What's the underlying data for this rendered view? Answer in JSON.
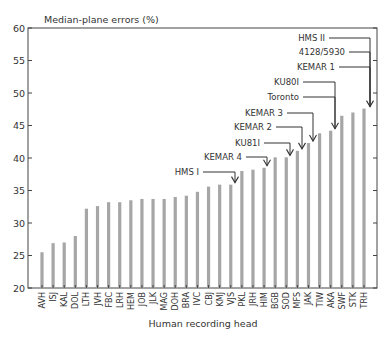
{
  "chart_data": {
    "type": "bar",
    "title": "",
    "ylabel": "Median-plane errors (%)",
    "xlabel": "Human recording head",
    "ylim": [
      20,
      60
    ],
    "yticks": [
      20,
      25,
      30,
      35,
      40,
      45,
      50,
      55,
      60
    ],
    "grid": false,
    "legend": null,
    "categories": [
      "AVH",
      "ISJ",
      "KAL",
      "DOL",
      "LTH",
      "JVH",
      "FBC",
      "LRH",
      "HEM",
      "JOB",
      "JLK",
      "MAG",
      "DOH",
      "BRA",
      "IVC",
      "CBJ",
      "KMJ",
      "VJS",
      "PKL",
      "JRH",
      "HIM",
      "BGB",
      "SOD",
      "MFS",
      "JAK",
      "TIW",
      "AKA",
      "SWF",
      "STK",
      "TRH"
    ],
    "values": [
      25.5,
      26.9,
      27.0,
      28.0,
      32.2,
      32.6,
      33.2,
      33.2,
      33.5,
      33.7,
      33.7,
      33.7,
      34.0,
      34.2,
      34.8,
      35.6,
      35.9,
      35.9,
      38.0,
      38.2,
      38.5,
      40.1,
      40.1,
      41.1,
      42.3,
      43.8,
      44.2,
      46.5,
      47.0,
      47.6
    ],
    "bar_color": "#a6a6a6",
    "annotations": [
      {
        "label": "HMS I",
        "target": "VJS",
        "text_y": 172,
        "text_right": 199
      },
      {
        "label": "KEMAR 4",
        "target": "HIM",
        "text_y": 157,
        "text_right": 242
      },
      {
        "label": "KU81I",
        "target": "SOD",
        "text_y": 143,
        "text_right": 260
      },
      {
        "label": "KEMAR 2",
        "target": "MFS",
        "text_y": 127,
        "text_right": 272
      },
      {
        "label": "KEMAR 3",
        "target": "JAK",
        "text_y": 113,
        "text_right": 283
      },
      {
        "label": "Toronto",
        "target": "AKA",
        "text_y": 97,
        "text_right": 299
      },
      {
        "label": "KU80I",
        "target": "AKA",
        "text_y": 82,
        "text_right": 299
      },
      {
        "label": "KEMAR 1",
        "target": "TRH",
        "text_y": 67,
        "text_right": 335
      },
      {
        "label": "4128/5930",
        "target": "TRH",
        "text_y": 52,
        "text_right": 345
      },
      {
        "label": "HMS II",
        "target": "TRH",
        "text_y": 38,
        "text_right": 325
      }
    ]
  }
}
